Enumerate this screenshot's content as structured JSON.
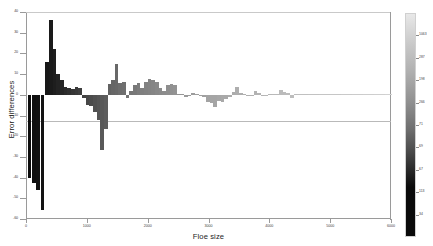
{
  "chart_data": {
    "type": "bar",
    "title": "",
    "xlabel": "Floe size",
    "ylabel": "Error differences",
    "xlim": [
      0,
      6000
    ],
    "ylim": [
      -60,
      40
    ],
    "grid": false,
    "legend": "colorbar-right",
    "colormap": "grayscale-dark-to-light",
    "xticks": [
      0,
      1000,
      2000,
      3000,
      4000,
      5000,
      6000
    ],
    "xticklabels": [
      "0",
      "1000",
      "2000",
      "3000",
      "4000",
      "5000",
      "6000"
    ],
    "yticks": [
      -60,
      -50,
      -40,
      -30,
      -20,
      -10,
      0,
      10,
      20,
      30,
      40
    ],
    "yticklabels": [
      "-60",
      "-50",
      "-40",
      "-30",
      "-20",
      "-10",
      "0",
      "10",
      "20",
      "30",
      "40"
    ],
    "colorbar": {
      "ticks": [
        1063,
        287,
        198,
        266,
        71,
        69,
        67,
        113,
        34
      ],
      "ticklabels": [
        "1063",
        "287",
        "198",
        "266",
        "71",
        "69",
        "67",
        "113",
        "34"
      ],
      "min_color": "#0a0a0a",
      "max_color": "#e8e8e8"
    },
    "x": [
      60,
      130,
      200,
      270,
      340,
      410,
      470,
      530,
      590,
      650,
      710,
      770,
      830,
      890,
      950,
      1010,
      1070,
      1130,
      1190,
      1250,
      1310,
      1370,
      1430,
      1490,
      1550,
      1610,
      1670,
      1730,
      1790,
      1850,
      1910,
      1970,
      2030,
      2090,
      2150,
      2210,
      2270,
      2330,
      2390,
      2450,
      2510,
      2570,
      2630,
      2690,
      2750,
      2810,
      2870,
      2930,
      2990,
      3050,
      3110,
      3170,
      3230,
      3290,
      3350,
      3410,
      3470,
      3530,
      3590,
      3650,
      3710,
      3770,
      3830,
      3890,
      3950,
      4010,
      4070,
      4130,
      4190,
      4250,
      4310,
      4370,
      4430,
      4490,
      4550,
      4610,
      4670,
      4730,
      4790,
      4850,
      4910,
      4970,
      5030,
      5090,
      5150,
      5210,
      5270,
      5330,
      5390,
      5450,
      5510,
      5570,
      5630,
      5690,
      5750,
      5810,
      5870,
      5930,
      5990
    ],
    "values": [
      -40.0,
      -42.5,
      -46.0,
      -55.5,
      16.0,
      36.0,
      22.0,
      10.0,
      7.0,
      4.0,
      3.5,
      3.0,
      4.0,
      3.5,
      -1.5,
      -5.0,
      -5.5,
      -8.5,
      -12.0,
      -26.5,
      -16.5,
      5.0,
      7.0,
      15.0,
      5.5,
      6.0,
      -1.5,
      2.0,
      4.5,
      5.5,
      3.5,
      6.0,
      7.5,
      7.0,
      6.0,
      3.5,
      2.0,
      4.5,
      5.0,
      4.5,
      0.3,
      0.2,
      -1.0,
      -0.8,
      1.0,
      0.4,
      -0.5,
      -1.0,
      -3.5,
      -4.0,
      -6.0,
      -3.0,
      -3.5,
      -2.0,
      -1.0,
      1.5,
      4.0,
      1.0,
      0.5,
      -0.8,
      -0.5,
      2.0,
      1.0,
      -0.5,
      -0.8,
      0.5,
      0.4,
      0.6,
      2.5,
      1.5,
      0.8,
      -1.5,
      0.5,
      0.4,
      0.3,
      0.5,
      0.3,
      0.4,
      0.6,
      0.5,
      0.3,
      0.2,
      0.3,
      0.4,
      0.3,
      0.3,
      0.2,
      0.3,
      0.3,
      0.2,
      0.2,
      0.3,
      0.3,
      0.2,
      0.4,
      0.3,
      0.2,
      0.3,
      0.2
    ],
    "bar_shades": [
      0.02,
      0.03,
      0.04,
      0.05,
      0.07,
      0.08,
      0.1,
      0.12,
      0.14,
      0.16,
      0.18,
      0.2,
      0.22,
      0.24,
      0.26,
      0.28,
      0.3,
      0.32,
      0.34,
      0.36,
      0.38,
      0.4,
      0.42,
      0.43,
      0.45,
      0.46,
      0.48,
      0.49,
      0.5,
      0.52,
      0.53,
      0.54,
      0.55,
      0.56,
      0.57,
      0.58,
      0.59,
      0.6,
      0.61,
      0.62,
      0.63,
      0.64,
      0.65,
      0.66,
      0.66,
      0.67,
      0.68,
      0.68,
      0.69,
      0.7,
      0.7,
      0.71,
      0.72,
      0.72,
      0.73,
      0.73,
      0.74,
      0.74,
      0.75,
      0.75,
      0.76,
      0.76,
      0.77,
      0.77,
      0.78,
      0.78,
      0.79,
      0.79,
      0.8,
      0.8,
      0.8,
      0.81,
      0.81,
      0.82,
      0.82,
      0.82,
      0.83,
      0.83,
      0.83,
      0.84,
      0.84,
      0.84,
      0.85,
      0.85,
      0.85,
      0.86,
      0.86,
      0.86,
      0.87,
      0.87,
      0.87,
      0.88,
      0.88,
      0.88,
      0.89,
      0.89,
      0.89,
      0.9,
      0.9
    ]
  }
}
